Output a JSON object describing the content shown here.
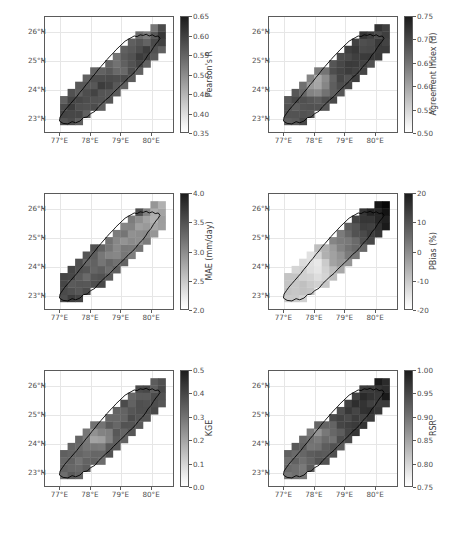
{
  "figure": {
    "layout": "3 rows x 2 columns",
    "region": "Narmada Basin, Central India",
    "background_color": "#ffffff",
    "colormap": "gray_reversed"
  },
  "axes_common": {
    "xticks": [
      "77°E",
      "78°E",
      "79°E",
      "80°E"
    ],
    "yticks": [
      "26°N",
      "25°N",
      "24°N",
      "23°N"
    ],
    "xlim": [
      76.5,
      80.75
    ],
    "ylim": [
      22.5,
      26.5
    ],
    "xtick_values": [
      77,
      78,
      79,
      80
    ],
    "ytick_values": [
      26,
      25,
      24,
      23
    ],
    "grid": true,
    "grid_color": "#e6e6e6",
    "frame_color": "#5a5a5a"
  },
  "chart_data": [
    {
      "type": "heatmap",
      "panel": 1,
      "position": "top-left",
      "title": "",
      "cbar_label": "Pearson's R",
      "xlabel": "",
      "ylabel": "",
      "vmin": 0.35,
      "vmax": 0.65,
      "cbar_ticks": [
        "0.35",
        "0.40",
        "0.45",
        "0.50",
        "0.55",
        "0.60",
        "0.65"
      ],
      "cbar_tick_values": [
        0.35,
        0.4,
        0.45,
        0.5,
        0.55,
        0.6,
        0.65
      ],
      "spatial_pattern": "moderate-to-high values (0.50-0.62) across most of the basin; a light low-value cell (~0.42) near 24.8°N 78.9°E; slightly lighter fringes along the far northeast near 26°N",
      "cell_size_deg": 0.25
    },
    {
      "type": "heatmap",
      "panel": 2,
      "position": "top-right",
      "title": "",
      "cbar_label": "Agreement Index (d)",
      "xlabel": "",
      "ylabel": "",
      "vmin": 0.5,
      "vmax": 0.75,
      "cbar_ticks": [
        "0.50",
        "0.55",
        "0.60",
        "0.65",
        "0.70",
        "0.75"
      ],
      "cbar_tick_values": [
        0.5,
        0.55,
        0.6,
        0.65,
        0.7,
        0.75
      ],
      "spatial_pattern": "mid-to-high agreement (0.62-0.72) in the north and east; a pronounced light low-value cluster (0.53-0.58) in the southwest-central basin around 24.0-24.5°N, 77.8-78.4°E",
      "cell_size_deg": 0.25
    },
    {
      "type": "heatmap",
      "panel": 3,
      "position": "middle-left",
      "title": "",
      "cbar_label": "MAE (mm/day)",
      "xlabel": "",
      "ylabel": "",
      "vmin": 2.0,
      "vmax": 4.0,
      "cbar_ticks": [
        "2.0",
        "2.5",
        "3.0",
        "3.5",
        "4.0"
      ],
      "cbar_tick_values": [
        2.0,
        2.5,
        3.0,
        3.5,
        4.0
      ],
      "spatial_pattern": "low error (2.2-2.6 mm/day) across the light northern and central-north interior; higher error (3.0-3.6 mm/day) in the southwest and along the southern rim; a dark high-error cell (~3.8) at the far northeast near 26°N 79.6°E",
      "cell_size_deg": 0.25
    },
    {
      "type": "heatmap",
      "panel": 4,
      "position": "middle-right",
      "title": "",
      "cbar_label": "PBias (%)",
      "xlabel": "",
      "ylabel": "",
      "vmin": -20,
      "vmax": 20,
      "cbar_ticks": [
        "-20",
        "-10",
        "0",
        "10",
        "20"
      ],
      "cbar_tick_values": [
        -20,
        -10,
        0,
        10,
        20
      ],
      "spatial_pattern": "strong positive bias (+15 to +20%) over the entire northeastern third of the basin (dark); near-zero to negative bias (-5 to -15%) in the bright west-central and southwestern lowlands; transition band through the middle",
      "cell_size_deg": 0.25
    },
    {
      "type": "heatmap",
      "panel": 5,
      "position": "bottom-left",
      "title": "",
      "cbar_label": "KGE",
      "xlabel": "",
      "ylabel": "",
      "vmin": 0.0,
      "vmax": 0.5,
      "cbar_ticks": [
        "0.0",
        "0.1",
        "0.2",
        "0.3",
        "0.4",
        "0.5"
      ],
      "cbar_tick_values": [
        0.0,
        0.1,
        0.2,
        0.3,
        0.4,
        0.5
      ],
      "spatial_pattern": "moderate KGE (0.25-0.38) over most of the basin; lower values (0.12-0.20) in scattered west-central cells around 24.2°N 78.2°E; highest (~0.40) along the central-eastern belt",
      "cell_size_deg": 0.25
    },
    {
      "type": "heatmap",
      "panel": 6,
      "position": "bottom-right",
      "title": "",
      "cbar_label": "RSR",
      "xlabel": "",
      "ylabel": "",
      "vmin": 0.75,
      "vmax": 1.0,
      "cbar_ticks": [
        "0.75",
        "0.80",
        "0.85",
        "0.90",
        "0.95",
        "1.00"
      ],
      "cbar_tick_values": [
        0.75,
        0.8,
        0.85,
        0.9,
        0.95,
        1.0
      ],
      "spatial_pattern": "RSR mostly 0.85-0.95 with darker (worse, near 0.97) cells in the northeast and along the northern edge; lighter (better, 0.78-0.84) cells in the west-central and southwestern basin",
      "cell_size_deg": 0.25
    }
  ]
}
